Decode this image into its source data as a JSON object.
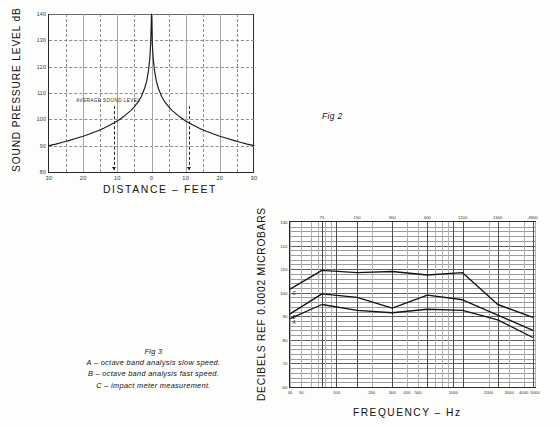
{
  "figure2": {
    "tag": "Fig 2",
    "y_axis_title": "SOUND PRESSURE LEVEL dB",
    "x_axis_title": "DISTANCE – FEET",
    "annotation": "AVERAGE SOUND LEVEL",
    "chart_data": {
      "type": "line",
      "title": "Fig 2",
      "xlabel": "DISTANCE – FEET",
      "ylabel": "SOUND PRESSURE LEVEL dB",
      "xlim": [
        -30,
        30
      ],
      "ylim": [
        80,
        140
      ],
      "grid": true,
      "legend": "none",
      "xticks": [
        -30,
        -20,
        -10,
        0,
        10,
        20,
        30
      ],
      "xticklabels": [
        "30",
        "20",
        "10",
        "0",
        "10",
        "20",
        "30"
      ],
      "yticks": [
        80,
        90,
        100,
        110,
        120,
        130,
        140
      ],
      "yticklabels": [
        "80",
        "90",
        "100",
        "110",
        "120",
        "130",
        "140"
      ],
      "annotations": [
        {
          "text": "AVERAGE SOUND LEVEL",
          "x": -22.0,
          "y": 106.5
        },
        {
          "text": "arrow-down-left",
          "x": -11.0,
          "y": 105.0
        },
        {
          "text": "arrow-down-right",
          "x": 11.0,
          "y": 105.0
        }
      ],
      "series": [
        {
          "name": "sound pressure level vs distance",
          "x": [
            -30,
            -28,
            -26,
            -24,
            -22,
            -20,
            -18,
            -16,
            -14,
            -12,
            -10,
            -8,
            -6,
            -5,
            -4,
            -3,
            -2,
            -1.4,
            -0.9,
            -0.5,
            -0.25,
            0,
            0.25,
            0.5,
            0.9,
            1.4,
            2,
            3,
            4,
            5,
            6,
            8,
            10,
            12,
            14,
            16,
            18,
            20,
            22,
            24,
            26,
            28,
            30
          ],
          "y": [
            90.0,
            90.6,
            91.3,
            92.0,
            92.8,
            93.6,
            94.5,
            95.5,
            96.6,
            97.9,
            99.4,
            101.2,
            103.4,
            104.8,
            106.4,
            108.6,
            111.8,
            114.6,
            118.4,
            123.0,
            128.5,
            140.0,
            128.5,
            123.0,
            118.4,
            114.6,
            111.8,
            108.6,
            106.4,
            104.8,
            103.4,
            101.2,
            99.4,
            97.9,
            96.6,
            95.5,
            94.5,
            93.6,
            92.8,
            92.0,
            91.3,
            90.6,
            90.0
          ]
        }
      ]
    }
  },
  "figure3": {
    "tag": "Fig 3",
    "caption_lines": [
      "A – octave band analysis slow speed.",
      "B – octave band analysis fast speed.",
      "C – impact meter measurement."
    ],
    "y_axis_title": "DECIBELS REF  0.0002  MICROBARS",
    "x_axis_title": "FREQUENCY – Hz",
    "chart_data": {
      "type": "line",
      "title": "Fig 3",
      "xlabel": "FREQUENCY – Hz",
      "ylabel": "DECIBELS REF  0.0002  MICROBARS",
      "xscale": "log",
      "xlim": [
        40,
        5000
      ],
      "ylim": [
        60,
        130
      ],
      "grid": true,
      "legend": "inline-curve-labels",
      "yticks": [
        60,
        70,
        80,
        90,
        100,
        110,
        120,
        130
      ],
      "yticklabels": [
        "60",
        "70",
        "80",
        "90",
        "100",
        "110",
        "120",
        "130"
      ],
      "xticks_bottom": [
        40,
        50,
        100,
        200,
        300,
        400,
        500,
        1000,
        2000,
        3000,
        4000,
        5000
      ],
      "xticklabels_bottom": [
        "40",
        "50",
        "100",
        "200",
        "300",
        "400",
        "500",
        "1000",
        "2000",
        "3000",
        "4000",
        "5000"
      ],
      "xticks_top": [
        75,
        150,
        300,
        600,
        1200,
        2400,
        4800
      ],
      "xticklabels_top": [
        "75",
        "150",
        "300",
        "600",
        "1200",
        "2400",
        "4800"
      ],
      "octave_band_centers": [
        75,
        150,
        300,
        600,
        1200,
        2400,
        4800
      ],
      "series": [
        {
          "name": "A",
          "label": "A",
          "description": "octave band analysis slow speed",
          "x": [
            40,
            75,
            150,
            300,
            600,
            1200,
            2400,
            4800
          ],
          "values": [
            89.0,
            95.0,
            92.5,
            91.5,
            93.0,
            92.5,
            88.5,
            81.0
          ]
        },
        {
          "name": "B",
          "label": "B",
          "description": "octave band analysis fast speed",
          "x": [
            40,
            75,
            150,
            300,
            600,
            1200,
            2400,
            4800
          ],
          "values": [
            91.0,
            99.5,
            98.0,
            93.5,
            99.0,
            97.0,
            90.5,
            84.0
          ]
        },
        {
          "name": "C",
          "label": "C",
          "description": "impact meter measurement",
          "x": [
            40,
            75,
            150,
            300,
            600,
            1200,
            2400,
            4800
          ],
          "values": [
            101.5,
            109.5,
            108.5,
            109.0,
            107.5,
            108.5,
            95.0,
            89.5
          ]
        }
      ]
    }
  }
}
